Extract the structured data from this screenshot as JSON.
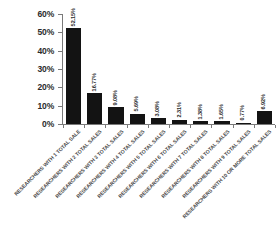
{
  "chart_data": {
    "type": "bar",
    "title": "",
    "xlabel": "",
    "ylabel": "",
    "ylim": [
      0,
      60
    ],
    "grid": false,
    "legend": "none",
    "ytick_labels": [
      "60%",
      "50%",
      "40%",
      "30%",
      "20%",
      "10%",
      "0%"
    ],
    "ytick_values": [
      60,
      50,
      40,
      30,
      20,
      10,
      0
    ],
    "categories": [
      "RESEARCHERS WITH 1 TOTAL SALE",
      "RESEARCHERS WITH 2 TOTAL SALES",
      "RESEARCHERS WITH 3 TOTAL SALES",
      "RESEARCHERS WITH 4 TOTAL SALES",
      "RESEARCHERS WITH 5 TOTAL SALES",
      "RESEARCHERS WITH 6 TOTAL SALES",
      "RESEARCHERS WITH 7 TOTAL SALES",
      "RESEARCHERS WITH 8 TOTAL SALES",
      "RESEARCHERS WITH 9 TOTAL SALES",
      "RESEARCHERS WITH 10 OR MORE TOTAL SALES"
    ],
    "values": [
      52.15,
      16.77,
      9.08,
      5.69,
      3.08,
      2.31,
      1.38,
      1.65,
      0.77,
      6.92
    ],
    "value_labels": [
      "52.15%",
      "16.77%",
      "9.08%",
      "5.69%",
      "3.08%",
      "2.31%",
      "1.38%",
      "1.65%",
      "0.77%",
      "6.92%"
    ],
    "bar_color": "#131313",
    "axis_color": "#7a7a7a",
    "label_color": "#2b2b2b",
    "category_label_color": "#4a4a4a",
    "background_color": "#ffffff"
  }
}
